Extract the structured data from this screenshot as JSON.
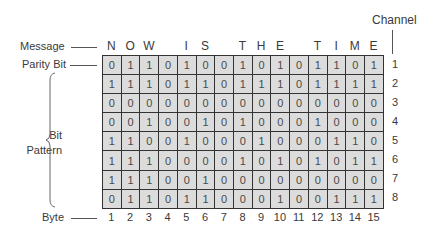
{
  "labels": {
    "message": "Message",
    "parity_bit": "Parity Bit",
    "bit_pattern_line1": "Bit",
    "bit_pattern_line2": "Pattern",
    "byte": "Byte",
    "channel": "Channel"
  },
  "message_letters": [
    "N",
    "O",
    "W",
    "",
    "I",
    "S",
    "",
    "T",
    "H",
    "E",
    "",
    "T",
    "I",
    "M",
    "E"
  ],
  "byte_numbers": [
    "1",
    "2",
    "3",
    "4",
    "5",
    "6",
    "7",
    "8",
    "9",
    "10",
    "11",
    "12",
    "13",
    "14",
    "15"
  ],
  "channel_numbers": [
    "1",
    "2",
    "3",
    "4",
    "5",
    "6",
    "7",
    "8"
  ],
  "grid": [
    [
      "0",
      "1",
      "1",
      "0",
      "1",
      "0",
      "0",
      "1",
      "0",
      "1",
      "0",
      "1",
      "1",
      "0",
      "1"
    ],
    [
      "1",
      "1",
      "1",
      "0",
      "1",
      "1",
      "0",
      "1",
      "1",
      "1",
      "0",
      "1",
      "1",
      "1",
      "1"
    ],
    [
      "0",
      "0",
      "0",
      "0",
      "0",
      "0",
      "0",
      "0",
      "0",
      "0",
      "0",
      "0",
      "0",
      "0",
      "0"
    ],
    [
      "0",
      "0",
      "1",
      "0",
      "0",
      "1",
      "0",
      "1",
      "0",
      "0",
      "0",
      "1",
      "0",
      "0",
      "0"
    ],
    [
      "1",
      "1",
      "0",
      "0",
      "1",
      "0",
      "0",
      "0",
      "1",
      "0",
      "0",
      "0",
      "1",
      "1",
      "0"
    ],
    [
      "1",
      "1",
      "1",
      "0",
      "0",
      "0",
      "0",
      "1",
      "0",
      "1",
      "0",
      "1",
      "0",
      "1",
      "1"
    ],
    [
      "1",
      "1",
      "1",
      "0",
      "0",
      "1",
      "0",
      "0",
      "0",
      "0",
      "0",
      "0",
      "0",
      "0",
      "0"
    ],
    [
      "0",
      "1",
      "1",
      "0",
      "1",
      "1",
      "0",
      "0",
      "0",
      "1",
      "0",
      "0",
      "1",
      "1",
      "1"
    ]
  ],
  "colors": {
    "cell_fill": "#dcdcdc",
    "border": "#333333",
    "text": "#3a3a3a"
  }
}
